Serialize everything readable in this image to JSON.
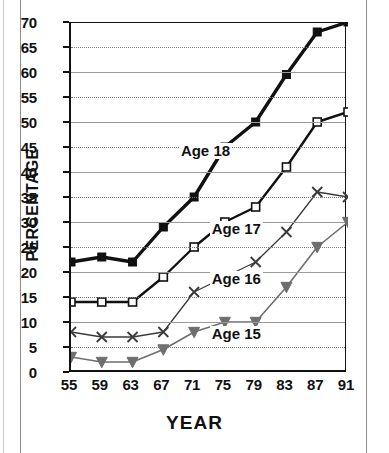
{
  "chart_data": {
    "type": "line",
    "title": "",
    "xlabel": "YEAR",
    "ylabel": "PERCENTAGE",
    "categories": [
      "55",
      "59",
      "63",
      "67",
      "71",
      "75",
      "79",
      "83",
      "87",
      "91"
    ],
    "x": [
      55,
      59,
      63,
      67,
      71,
      75,
      79,
      83,
      87,
      91
    ],
    "xlim": [
      55,
      91
    ],
    "ylim": [
      0,
      70
    ],
    "ytick_labels": [
      "0",
      "5",
      "10",
      "15",
      "20",
      "25",
      "30",
      "35",
      "40",
      "45",
      "50",
      "55",
      "60",
      "65",
      "70"
    ],
    "yticks": [
      0,
      5,
      10,
      15,
      20,
      25,
      30,
      35,
      40,
      45,
      50,
      55,
      60,
      65,
      70
    ],
    "grid": true,
    "legend": "inline-annotations",
    "series": [
      {
        "name": "Age 18",
        "marker": "filled-square",
        "color": "#111111",
        "values": [
          22,
          23,
          22,
          29,
          35,
          45,
          50,
          59.5,
          68,
          70
        ]
      },
      {
        "name": "Age 17",
        "marker": "open-square",
        "color": "#111111",
        "values": [
          14,
          14,
          14,
          19,
          25,
          30,
          33,
          41,
          50,
          52
        ]
      },
      {
        "name": "Age 16",
        "marker": "x-cross",
        "color": "#3a3a3a",
        "values": [
          8,
          7,
          7,
          8,
          16,
          19,
          22,
          28,
          36,
          35
        ]
      },
      {
        "name": "Age 15",
        "marker": "filled-triangle-down",
        "color": "#6e6e6e",
        "values": [
          3,
          2,
          2,
          4.5,
          8,
          10,
          10,
          17,
          25,
          30
        ]
      }
    ],
    "annotations": [
      {
        "text": "Age 18",
        "x": 75,
        "y": 44
      },
      {
        "text": "Age 17",
        "x": 79,
        "y": 28.5
      },
      {
        "text": "Age 16",
        "x": 79,
        "y": 18.5
      },
      {
        "text": "Age 15",
        "x": 79,
        "y": 7.5
      }
    ]
  }
}
